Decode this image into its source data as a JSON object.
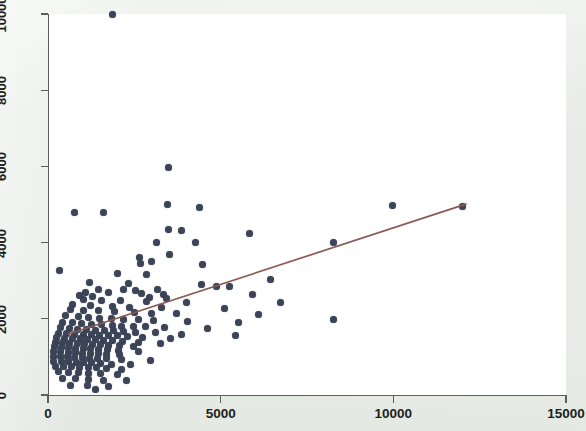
{
  "figure": {
    "kind": "scatter-plot-with-fit-line",
    "background_color": "#e9ece8",
    "plot_background_color": "#ffffff",
    "marker_color": "#3b4557",
    "fit_line_color": "#8b5a52",
    "axis_color": "#5c5f5c"
  },
  "chart_data": {
    "type": "scatter",
    "title": "",
    "subtitle": "",
    "xlabel": "",
    "ylabel": "",
    "xlim": [
      0,
      15000
    ],
    "ylim": [
      0,
      10000
    ],
    "xticks": [
      0,
      5000,
      10000,
      15000
    ],
    "yticks": [
      0,
      2000,
      4000,
      6000,
      8000,
      10000
    ],
    "xtick_labels": [
      "0",
      "5000",
      "10000",
      "15000"
    ],
    "ytick_labels": [
      "0",
      "2000",
      "4000",
      "6000",
      "8000",
      "10000"
    ],
    "grid": false,
    "legend": null,
    "legend_position": "none",
    "marker_size_px": 7,
    "series": [
      {
        "name": "observations",
        "type": "scatter",
        "color": "#3b4557",
        "points": [
          [
            1880,
            10000
          ],
          [
            3490,
            5980
          ],
          [
            3460,
            5000
          ],
          [
            4400,
            4930
          ],
          [
            11990,
            4960
          ],
          [
            9990,
            4980
          ],
          [
            760,
            4800
          ],
          [
            1620,
            4800
          ],
          [
            3490,
            4350
          ],
          [
            3860,
            4330
          ],
          [
            5840,
            4240
          ],
          [
            3140,
            4010
          ],
          [
            4260,
            3990
          ],
          [
            8280,
            4010
          ],
          [
            3520,
            3680
          ],
          [
            2660,
            3620
          ],
          [
            3000,
            3510
          ],
          [
            2680,
            3450
          ],
          [
            4480,
            3420
          ],
          [
            340,
            3260
          ],
          [
            2000,
            3190
          ],
          [
            2840,
            3160
          ],
          [
            6440,
            3020
          ],
          [
            1200,
            2940
          ],
          [
            2320,
            2920
          ],
          [
            4440,
            2890
          ],
          [
            4870,
            2840
          ],
          [
            5270,
            2860
          ],
          [
            2200,
            2780
          ],
          [
            1460,
            2760
          ],
          [
            2540,
            2740
          ],
          [
            3180,
            2760
          ],
          [
            1080,
            2700
          ],
          [
            1750,
            2700
          ],
          [
            2720,
            2660
          ],
          [
            3340,
            2640
          ],
          [
            5930,
            2640
          ],
          [
            900,
            2620
          ],
          [
            1300,
            2580
          ],
          [
            2940,
            2560
          ],
          [
            3430,
            2520
          ],
          [
            1030,
            2500
          ],
          [
            1540,
            2480
          ],
          [
            2100,
            2470
          ],
          [
            2860,
            2450
          ],
          [
            4000,
            2420
          ],
          [
            6720,
            2420
          ],
          [
            720,
            2380
          ],
          [
            1240,
            2360
          ],
          [
            1880,
            2330
          ],
          [
            2370,
            2300
          ],
          [
            3290,
            2300
          ],
          [
            5100,
            2270
          ],
          [
            640,
            2250
          ],
          [
            1020,
            2230
          ],
          [
            1460,
            2210
          ],
          [
            1940,
            2180
          ],
          [
            2510,
            2160
          ],
          [
            3010,
            2150
          ],
          [
            3730,
            2130
          ],
          [
            6090,
            2120
          ],
          [
            8280,
            1990
          ],
          [
            520,
            2080
          ],
          [
            870,
            2060
          ],
          [
            1180,
            2040
          ],
          [
            1500,
            2020
          ],
          [
            1830,
            2010
          ],
          [
            2180,
            1990
          ],
          [
            2630,
            1980
          ],
          [
            3060,
            1960
          ],
          [
            4050,
            1930
          ],
          [
            5530,
            1910
          ],
          [
            430,
            1900
          ],
          [
            700,
            1890
          ],
          [
            980,
            1870
          ],
          [
            1260,
            1860
          ],
          [
            1560,
            1840
          ],
          [
            1860,
            1830
          ],
          [
            2140,
            1810
          ],
          [
            2480,
            1800
          ],
          [
            2820,
            1790
          ],
          [
            3360,
            1770
          ],
          [
            4610,
            1740
          ],
          [
            360,
            1760
          ],
          [
            610,
            1750
          ],
          [
            860,
            1730
          ],
          [
            1120,
            1720
          ],
          [
            1380,
            1700
          ],
          [
            1640,
            1690
          ],
          [
            1910,
            1680
          ],
          [
            2190,
            1670
          ],
          [
            2520,
            1650
          ],
          [
            3120,
            1630
          ],
          [
            3880,
            1600
          ],
          [
            5440,
            1570
          ],
          [
            300,
            1620
          ],
          [
            540,
            1610
          ],
          [
            780,
            1600
          ],
          [
            1020,
            1590
          ],
          [
            1260,
            1580
          ],
          [
            1500,
            1570
          ],
          [
            1740,
            1560
          ],
          [
            2000,
            1550
          ],
          [
            2300,
            1530
          ],
          [
            2740,
            1510
          ],
          [
            3540,
            1480
          ],
          [
            250,
            1500
          ],
          [
            480,
            1490
          ],
          [
            700,
            1480
          ],
          [
            930,
            1470
          ],
          [
            1150,
            1460
          ],
          [
            1380,
            1450
          ],
          [
            1610,
            1440
          ],
          [
            1860,
            1430
          ],
          [
            2160,
            1410
          ],
          [
            2620,
            1390
          ],
          [
            3260,
            1360
          ],
          [
            210,
            1380
          ],
          [
            420,
            1370
          ],
          [
            630,
            1360
          ],
          [
            850,
            1350
          ],
          [
            1070,
            1340
          ],
          [
            1290,
            1330
          ],
          [
            1520,
            1320
          ],
          [
            1760,
            1310
          ],
          [
            2060,
            1290
          ],
          [
            2480,
            1270
          ],
          [
            180,
            1260
          ],
          [
            390,
            1250
          ],
          [
            600,
            1240
          ],
          [
            810,
            1230
          ],
          [
            1020,
            1220
          ],
          [
            1240,
            1210
          ],
          [
            1470,
            1200
          ],
          [
            1720,
            1190
          ],
          [
            2030,
            1170
          ],
          [
            2620,
            1140
          ],
          [
            160,
            1140
          ],
          [
            370,
            1130
          ],
          [
            580,
            1120
          ],
          [
            790,
            1110
          ],
          [
            1000,
            1100
          ],
          [
            1220,
            1090
          ],
          [
            1450,
            1080
          ],
          [
            1700,
            1070
          ],
          [
            2080,
            1050
          ],
          [
            150,
            1020
          ],
          [
            360,
            1010
          ],
          [
            570,
            1000
          ],
          [
            780,
            990
          ],
          [
            990,
            980
          ],
          [
            1210,
            970
          ],
          [
            1440,
            960
          ],
          [
            1700,
            950
          ],
          [
            2120,
            930
          ],
          [
            2960,
            900
          ],
          [
            170,
            890
          ],
          [
            380,
            880
          ],
          [
            600,
            870
          ],
          [
            820,
            860
          ],
          [
            1040,
            850
          ],
          [
            1270,
            840
          ],
          [
            1520,
            830
          ],
          [
            1830,
            810
          ],
          [
            2400,
            790
          ],
          [
            230,
            760
          ],
          [
            460,
            750
          ],
          [
            690,
            740
          ],
          [
            920,
            730
          ],
          [
            1160,
            720
          ],
          [
            1410,
            710
          ],
          [
            1700,
            690
          ],
          [
            2130,
            670
          ],
          [
            300,
            620
          ],
          [
            580,
            600
          ],
          [
            880,
            590
          ],
          [
            1180,
            575
          ],
          [
            1520,
            560
          ],
          [
            2020,
            540
          ],
          [
            430,
            440
          ],
          [
            790,
            420
          ],
          [
            1180,
            400
          ],
          [
            1620,
            390
          ],
          [
            2280,
            370
          ],
          [
            640,
            260
          ],
          [
            1140,
            240
          ],
          [
            1760,
            210
          ],
          [
            1380,
            140
          ]
        ]
      },
      {
        "name": "fitted-regression-line",
        "type": "line",
        "color": "#8b5a52",
        "x_start": 600,
        "y_start": 1600,
        "x_end": 12100,
        "y_end": 5010
      }
    ]
  },
  "geometry": {
    "plot_left_px": 48,
    "plot_right_px": 566,
    "plot_top_px": 14,
    "plot_bottom_px": 395,
    "x_min": 0,
    "x_max": 15000,
    "y_min": 0,
    "y_max": 10000
  }
}
